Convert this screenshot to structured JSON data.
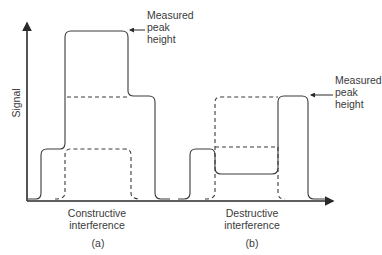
{
  "figure": {
    "y_axis_label": "Signal",
    "panels": [
      {
        "id": "a",
        "panel_label": "(a)",
        "title_line1": "Constructive",
        "title_line2": "interference",
        "annotation_line1": "Measured",
        "annotation_line2": "peak",
        "annotation_line3": "height"
      },
      {
        "id": "b",
        "panel_label": "(b)",
        "title_line1": "Destructive",
        "title_line2": "interference",
        "annotation_line1": "Measured",
        "annotation_line2": "peak",
        "annotation_line3": "height"
      }
    ],
    "colors": {
      "line": "#3a3a3a",
      "text": "#3a3a3a"
    }
  }
}
